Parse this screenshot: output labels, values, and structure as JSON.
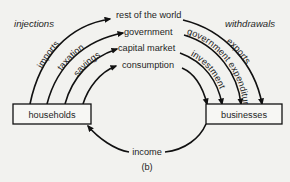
{
  "diagram": {
    "title_left": "injections",
    "title_right": "withdrawals",
    "nodes": {
      "households": "households",
      "businesses": "businesses",
      "rest_of_world": "rest of the world",
      "government": "government",
      "capital_market": "capital market",
      "consumption_line1": "consumption",
      "consumption_line2": "expenditure",
      "income": "income"
    },
    "injections": [
      "imports",
      "taxation",
      "savings"
    ],
    "withdrawals": [
      "exports",
      "government expenditure",
      "investment"
    ],
    "caption": "(b)"
  }
}
